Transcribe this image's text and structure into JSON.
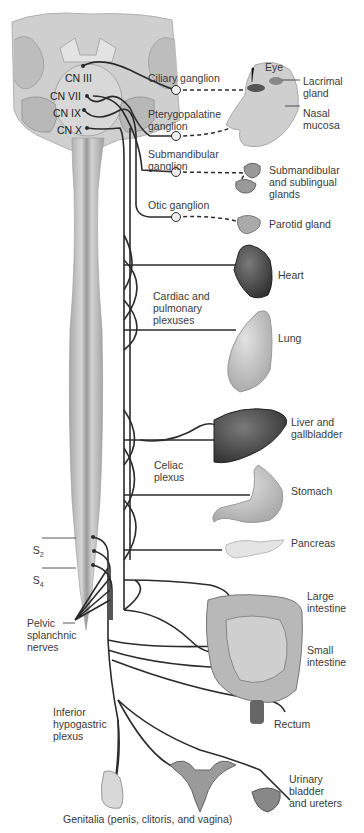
{
  "cranial_nerves": [
    {
      "id": "cn3",
      "label": "CN III"
    },
    {
      "id": "cn7",
      "label": "CN VII"
    },
    {
      "id": "cn9",
      "label": "CN IX"
    },
    {
      "id": "cn10",
      "label": "CN X"
    }
  ],
  "ganglia": [
    {
      "id": "ciliary",
      "label": "Ciliary ganglion"
    },
    {
      "id": "pterygopalatine",
      "label": "Pterygopalatine\nganglion"
    },
    {
      "id": "submandibular",
      "label": "Submandibular\nganglion"
    },
    {
      "id": "otic",
      "label": "Otic ganglion"
    }
  ],
  "plexuses": [
    {
      "id": "cardiac",
      "label": "Cardiac and\npulmonary\nplexuses"
    },
    {
      "id": "celiac",
      "label": "Celiac\nplexus"
    },
    {
      "id": "inferior_hypogastric",
      "label": "Inferior\nhypogastric\nplexus"
    }
  ],
  "spinal": {
    "s2": {
      "main": "S",
      "sub": "2"
    },
    "s4": {
      "main": "S",
      "sub": "4"
    },
    "pelvic_splanchnic": "Pelvic\nsplanchnic\nnerves"
  },
  "organs": [
    {
      "id": "eye",
      "label": "Eye"
    },
    {
      "id": "lacrimal",
      "label": "Lacrimal\ngland"
    },
    {
      "id": "nasal",
      "label": "Nasal\nmucosa"
    },
    {
      "id": "submandibular_glands",
      "label": "Submandibular\nand sublingual\nglands"
    },
    {
      "id": "parotid",
      "label": "Parotid gland"
    },
    {
      "id": "heart",
      "label": "Heart"
    },
    {
      "id": "lung",
      "label": "Lung"
    },
    {
      "id": "liver",
      "label": "Liver and\ngallbladder"
    },
    {
      "id": "stomach",
      "label": "Stomach"
    },
    {
      "id": "pancreas",
      "label": "Pancreas"
    },
    {
      "id": "large_intestine",
      "label": "Large\nintestine"
    },
    {
      "id": "small_intestine",
      "label": "Small\nintestine"
    },
    {
      "id": "rectum",
      "label": "Rectum"
    },
    {
      "id": "bladder",
      "label": "Urinary\nbladder\nand ureters"
    },
    {
      "id": "genitalia",
      "label": "Genitalia (penis, clitoris, and vagina)"
    }
  ],
  "colors": {
    "nerve": "#2b2b2b",
    "brain": "#c9c9c9",
    "brain_dark": "#9a9a9a",
    "cord": "#bdbdbd",
    "organ_dark": "#4a4a4a",
    "organ_light": "#c8c8c8"
  }
}
